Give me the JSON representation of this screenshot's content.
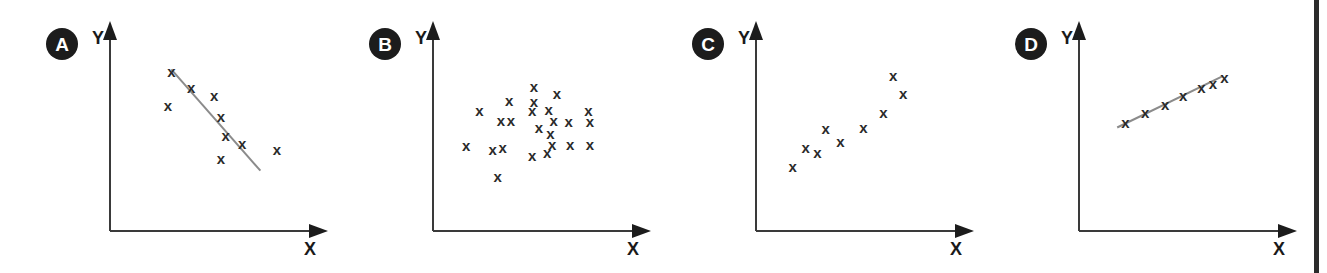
{
  "figure": {
    "background_color": "#ffffff",
    "marker_glyph": "x",
    "marker_color": "#2a2a2a",
    "axis_color": "#3a3a3a",
    "trend_line_color": "#8b8b8b",
    "badge_color": "#1c1c1c",
    "badge_text_color": "#ffffff",
    "page_edge_color": "#2b2b2b"
  },
  "chart_data": [
    {
      "type": "scatter",
      "panel_label": "A",
      "title": "",
      "xlabel": "X",
      "ylabel": "Y",
      "grid": false,
      "legend": "none",
      "relationship": "strong negative correlation",
      "trend_line": true,
      "trend_line_points": [
        [
          0.22,
          0.93
        ],
        [
          0.76,
          0.18
        ]
      ],
      "xlim": [
        0,
        1
      ],
      "ylim": [
        0,
        1
      ],
      "points": [
        [
          0.22,
          0.91
        ],
        [
          0.34,
          0.79
        ],
        [
          0.2,
          0.66
        ],
        [
          0.48,
          0.73
        ],
        [
          0.52,
          0.58
        ],
        [
          0.55,
          0.44
        ],
        [
          0.65,
          0.38
        ],
        [
          0.52,
          0.27
        ],
        [
          0.86,
          0.33
        ]
      ]
    },
    {
      "type": "scatter",
      "panel_label": "B",
      "title": "",
      "xlabel": "X",
      "ylabel": "Y",
      "grid": false,
      "legend": "none",
      "relationship": "no correlation",
      "trend_line": false,
      "xlim": [
        0,
        1
      ],
      "ylim": [
        0,
        1
      ],
      "points": [
        [
          0.46,
          0.8
        ],
        [
          0.31,
          0.7
        ],
        [
          0.46,
          0.69
        ],
        [
          0.13,
          0.62
        ],
        [
          0.6,
          0.75
        ],
        [
          0.45,
          0.62
        ],
        [
          0.55,
          0.63
        ],
        [
          0.79,
          0.62
        ],
        [
          0.26,
          0.55
        ],
        [
          0.32,
          0.55
        ],
        [
          0.49,
          0.5
        ],
        [
          0.58,
          0.55
        ],
        [
          0.67,
          0.54
        ],
        [
          0.8,
          0.54
        ],
        [
          0.56,
          0.45
        ],
        [
          0.05,
          0.36
        ],
        [
          0.21,
          0.33
        ],
        [
          0.27,
          0.35
        ],
        [
          0.57,
          0.37
        ],
        [
          0.68,
          0.37
        ],
        [
          0.8,
          0.37
        ],
        [
          0.45,
          0.29
        ],
        [
          0.54,
          0.31
        ],
        [
          0.24,
          0.13
        ]
      ]
    },
    {
      "type": "scatter",
      "panel_label": "C",
      "title": "",
      "xlabel": "X",
      "ylabel": "Y",
      "grid": false,
      "legend": "none",
      "relationship": "moderate positive correlation",
      "trend_line": false,
      "xlim": [
        0,
        1
      ],
      "ylim": [
        0,
        1
      ],
      "points": [
        [
          0.07,
          0.21
        ],
        [
          0.15,
          0.35
        ],
        [
          0.22,
          0.31
        ],
        [
          0.27,
          0.49
        ],
        [
          0.36,
          0.39
        ],
        [
          0.5,
          0.5
        ],
        [
          0.62,
          0.61
        ],
        [
          0.68,
          0.88
        ],
        [
          0.74,
          0.75
        ]
      ]
    },
    {
      "type": "scatter",
      "panel_label": "D",
      "title": "",
      "xlabel": "X",
      "ylabel": "Y",
      "grid": false,
      "legend": "none",
      "relationship": "perfect positive linear correlation",
      "trend_line": true,
      "trend_line_points": [
        [
          0.08,
          0.5
        ],
        [
          0.72,
          0.88
        ]
      ],
      "xlim": [
        0,
        1
      ],
      "ylim": [
        0,
        1
      ],
      "points": [
        [
          0.13,
          0.53
        ],
        [
          0.25,
          0.61
        ],
        [
          0.37,
          0.67
        ],
        [
          0.48,
          0.73
        ],
        [
          0.59,
          0.79
        ],
        [
          0.66,
          0.82
        ],
        [
          0.73,
          0.87
        ]
      ]
    }
  ]
}
